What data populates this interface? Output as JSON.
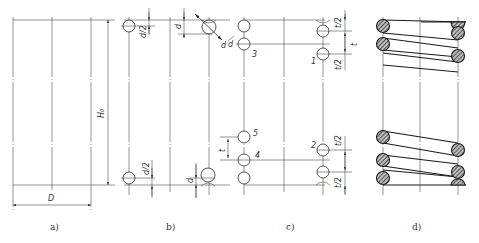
{
  "figure": {
    "panels": [
      {
        "id": "a",
        "label": "a)",
        "dims": {
          "free_height": "H₀",
          "diameter": "D"
        }
      },
      {
        "id": "b",
        "label": "b)",
        "dims": {
          "half_d_top": "d/2",
          "d_top": "d",
          "half_d_bottom": "d/2",
          "d_bottom": "d",
          "wire": "d"
        }
      },
      {
        "id": "c",
        "label": "c)",
        "dims": {
          "half_t_1": "t/2",
          "half_t_2": "t/2",
          "t_top": "t",
          "t_left": "t",
          "half_t_3": "t/2",
          "half_t_4": "t/2",
          "wire": "d"
        },
        "circle_numbers": [
          "1",
          "2",
          "3",
          "4",
          "5"
        ]
      },
      {
        "id": "d",
        "label": "d)"
      }
    ]
  },
  "colors": {
    "line": "#2a2a2a",
    "background": "#ffffff"
  }
}
